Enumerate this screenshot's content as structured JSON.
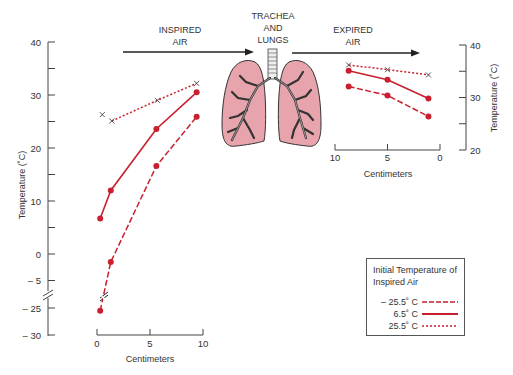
{
  "labels": {
    "inspired": [
      "INSPIRED",
      "AIR"
    ],
    "trachea": [
      "TRACHEA",
      "AND",
      "LUNGS"
    ],
    "expired": [
      "EXPIRED",
      "AIR"
    ]
  },
  "colors": {
    "series": "#c8202e",
    "axis": "#444444",
    "lung_fill": "#e8a4ad",
    "lung_stroke": "#333333",
    "arrow": "#222222"
  },
  "legend": {
    "title": [
      "Initial Temperature of",
      "Inspired Air"
    ],
    "items": [
      {
        "label": "– 25.5˚ C",
        "style": "dashed"
      },
      {
        "label": "6.5˚ C",
        "style": "solid"
      },
      {
        "label": "25.5˚ C",
        "style": "dotted"
      }
    ]
  },
  "chart_data": [
    {
      "type": "line",
      "title": "Inspired Air",
      "xlabel": "Centimeters",
      "ylabel": "Temperature (˚C)",
      "xlim": [
        0,
        10
      ],
      "xticks": [
        0,
        5,
        10
      ],
      "ylim": [
        -30,
        40
      ],
      "yticks": [
        -30,
        -25,
        -5,
        0,
        10,
        20,
        30,
        40
      ],
      "yticklabels": [
        "– 30",
        "– 25",
        "– 5",
        "0",
        "10",
        "20",
        "30",
        "40"
      ],
      "axis_break": "between -5 and -25",
      "grid": false,
      "series": [
        {
          "name": "– 25.5˚ C",
          "style": "dashed",
          "x": [
            0.3,
            1.3,
            5.6,
            9.4
          ],
          "y": [
            -25.5,
            -1.5,
            16.6,
            25.9
          ]
        },
        {
          "name": "6.5˚ C",
          "style": "solid",
          "x": [
            0.3,
            1.3,
            5.6,
            9.4
          ],
          "y": [
            6.7,
            12.0,
            23.6,
            30.5
          ]
        },
        {
          "name": "25.5˚ C",
          "style": "dotted",
          "x": [
            0.5,
            1.4,
            5.7,
            9.4
          ],
          "y": [
            26.3,
            25.1,
            29.0,
            32.2
          ],
          "note": "first point is an unconnected x marker"
        }
      ]
    },
    {
      "type": "line",
      "title": "Expired Air",
      "xlabel": "Centimeters",
      "ylabel": "Temperature (˚C)",
      "xlim": [
        10,
        0
      ],
      "xticks": [
        10,
        5,
        0
      ],
      "ylim": [
        20,
        40
      ],
      "yticks": [
        20,
        25,
        30,
        35,
        40
      ],
      "yticklabels": [
        "20",
        "",
        "30",
        "",
        "40"
      ],
      "grid": false,
      "series": [
        {
          "name": "– 25.5˚ C",
          "style": "dashed",
          "x": [
            8.7,
            5.0,
            1.1
          ],
          "y": [
            32.1,
            30.4,
            26.4
          ]
        },
        {
          "name": "6.5˚ C",
          "style": "solid",
          "x": [
            8.7,
            5.0,
            1.1
          ],
          "y": [
            35.1,
            33.4,
            29.8
          ]
        },
        {
          "name": "25.5˚ C",
          "style": "dotted",
          "x": [
            8.7,
            5.0,
            1.1
          ],
          "y": [
            36.2,
            35.3,
            34.3
          ]
        }
      ]
    }
  ]
}
